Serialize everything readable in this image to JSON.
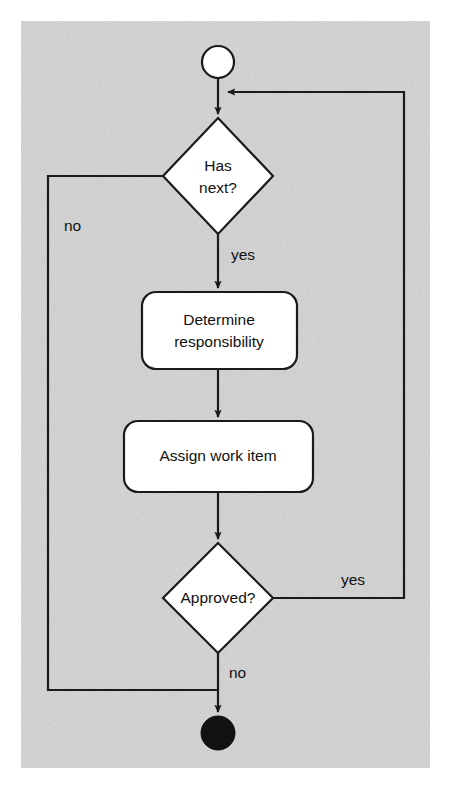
{
  "canvas": {
    "width": 452,
    "height": 789,
    "background_color": "#ffffff"
  },
  "panel": {
    "label": "diagram-panel",
    "x": 21,
    "y": 21,
    "width": 409,
    "height": 747,
    "fill_color": "#d4d4d4",
    "grain": true
  },
  "style": {
    "stroke_color": "#1a1a1a",
    "node_fill": "#ffffff",
    "stroke_width": 2.2,
    "text_color": "#111111"
  },
  "diagram": {
    "type": "uml-activity-diagram",
    "title": "",
    "nodes": [
      {
        "id": "start",
        "kind": "initial-node",
        "shape": "circle",
        "label": "",
        "cx": 218,
        "cy": 62,
        "r": 16,
        "fill": "#ffffff"
      },
      {
        "id": "has-next",
        "kind": "decision",
        "shape": "diamond",
        "label": "Has\nnext?",
        "label_line1": "Has",
        "label_line2": "next?",
        "cx": 218,
        "cy": 176,
        "rx": 55,
        "ry": 58,
        "fill": "#ffffff"
      },
      {
        "id": "determine-responsibility",
        "kind": "action",
        "shape": "rounded-rect",
        "label": "Determine\nresponsibility",
        "label_line1": "Determine",
        "label_line2": "responsibility",
        "x": 142,
        "y": 292,
        "width": 155,
        "height": 77,
        "rx": 14,
        "fill": "#ffffff"
      },
      {
        "id": "assign-work-item",
        "kind": "action",
        "shape": "rounded-rect",
        "label": "Assign work item",
        "label_line1": "Assign work item",
        "x": 124,
        "y": 421,
        "width": 189,
        "height": 71,
        "rx": 14,
        "fill": "#ffffff"
      },
      {
        "id": "approved",
        "kind": "decision",
        "shape": "diamond",
        "label": "Approved?",
        "label_line1": "Approved?",
        "cx": 218,
        "cy": 598,
        "rx": 55,
        "ry": 55,
        "fill": "#ffffff"
      },
      {
        "id": "end",
        "kind": "final-node",
        "shape": "filled-circle",
        "label": "",
        "cx": 218,
        "cy": 733,
        "r": 17,
        "fill": "#111111"
      }
    ],
    "edges": [
      {
        "id": "start-to-has-next",
        "from": "start",
        "to": "has-next",
        "label": "",
        "arrow": true,
        "path": "M 218 78 L 218 116"
      },
      {
        "id": "has-next-yes",
        "from": "has-next",
        "to": "determine-responsibility",
        "label": "yes",
        "label_x": 231,
        "label_y": 256,
        "arrow": true,
        "path": "M 218 234 L 218 290"
      },
      {
        "id": "has-next-no",
        "from": "has-next",
        "to": "end",
        "label": "no",
        "label_x": 64,
        "label_y": 227,
        "arrow": false,
        "path": "M 163 176 L 48 176 L 48 690 L 218 690"
      },
      {
        "id": "determine-to-assign",
        "from": "determine-responsibility",
        "to": "assign-work-item",
        "label": "",
        "arrow": true,
        "path": "M 218 369 L 218 419"
      },
      {
        "id": "assign-to-approved",
        "from": "assign-work-item",
        "to": "approved",
        "label": "",
        "arrow": true,
        "path": "M 218 492 L 218 541"
      },
      {
        "id": "approved-yes",
        "from": "approved",
        "to": "has-next",
        "label": "yes",
        "label_x": 341,
        "label_y": 580,
        "arrow": true,
        "path": "M 273 598 L 404 598 L 404 92 L 226 92"
      },
      {
        "id": "approved-no",
        "from": "approved",
        "to": "end",
        "label": "no",
        "label_x": 229,
        "label_y": 673,
        "arrow": true,
        "path": "M 218 653 L 218 714"
      }
    ]
  }
}
